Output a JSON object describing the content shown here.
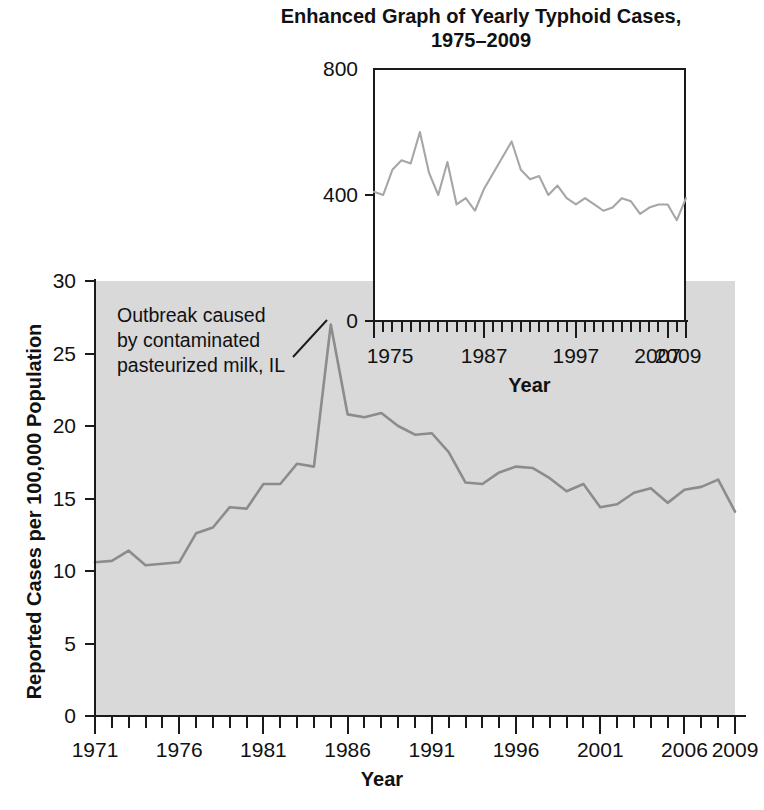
{
  "inset": {
    "title": "Enhanced Graph of Yearly Typhoid Cases,\n1975–2009",
    "xlabel": "Year",
    "y_ticks": [
      "800",
      "400",
      "0"
    ],
    "x_ticks": [
      "1975",
      "1987",
      "1997",
      "2007",
      "2009"
    ]
  },
  "main": {
    "xlabel": "Year",
    "ylabel": "Reported Cases per 100,000 Population",
    "y_ticks": [
      "30",
      "25",
      "20",
      "15",
      "10",
      "5",
      "0"
    ],
    "x_ticks": [
      "1971",
      "1976",
      "1981",
      "1986",
      "1991",
      "1996",
      "2001",
      "2006",
      "2009"
    ],
    "annotation": "Outbreak caused\nby contaminated\npasteurized milk, IL"
  },
  "colors": {
    "panel_background": "#d9d9d9",
    "inset_background": "#ffffff",
    "axis": "#1a1a1a",
    "series_main": "#8c8c8c",
    "series_inset": "#a6a6a6",
    "text": "#111111"
  },
  "chart_data": [
    {
      "type": "line",
      "name": "main-typhoid-rate",
      "title": "",
      "xlabel": "Year",
      "ylabel": "Reported Cases per 100,000 Population",
      "xlim": [
        1971,
        2009
      ],
      "ylim": [
        0,
        30
      ],
      "grid": false,
      "legend": "none",
      "x": [
        1971,
        1972,
        1973,
        1974,
        1975,
        1976,
        1977,
        1978,
        1979,
        1980,
        1981,
        1982,
        1983,
        1984,
        1985,
        1986,
        1987,
        1988,
        1989,
        1990,
        1991,
        1992,
        1993,
        1994,
        1995,
        1996,
        1997,
        1998,
        1999,
        2000,
        2001,
        2002,
        2003,
        2004,
        2005,
        2006,
        2007,
        2008,
        2009
      ],
      "values": [
        10.6,
        10.7,
        11.4,
        10.4,
        10.5,
        10.6,
        12.6,
        13.0,
        14.4,
        14.3,
        16.0,
        16.0,
        17.4,
        17.2,
        27.0,
        20.8,
        20.6,
        20.9,
        20.0,
        19.4,
        19.5,
        18.2,
        16.1,
        16.0,
        16.8,
        17.2,
        17.1,
        16.4,
        15.5,
        16.0,
        14.4,
        14.6,
        15.4,
        15.7,
        14.7,
        15.6,
        15.8,
        16.3,
        14.1
      ]
    },
    {
      "type": "line",
      "name": "inset-typhoid-cases",
      "title": "Enhanced Graph of Yearly Typhoid Cases, 1975–2009",
      "xlabel": "Year",
      "ylabel": "",
      "xlim": [
        1975,
        2009
      ],
      "ylim": [
        0,
        800
      ],
      "grid": false,
      "legend": "none",
      "x": [
        1975,
        1976,
        1977,
        1978,
        1979,
        1980,
        1981,
        1982,
        1983,
        1984,
        1985,
        1986,
        1987,
        1988,
        1989,
        1990,
        1991,
        1992,
        1993,
        1994,
        1995,
        1996,
        1997,
        1998,
        1999,
        2000,
        2001,
        2002,
        2003,
        2004,
        2005,
        2006,
        2007,
        2008,
        2009
      ],
      "values": [
        410,
        400,
        480,
        510,
        500,
        600,
        470,
        400,
        505,
        370,
        390,
        350,
        420,
        470,
        520,
        570,
        480,
        450,
        460,
        400,
        430,
        390,
        370,
        390,
        370,
        350,
        360,
        390,
        380,
        340,
        360,
        370,
        370,
        320,
        390
      ]
    }
  ]
}
